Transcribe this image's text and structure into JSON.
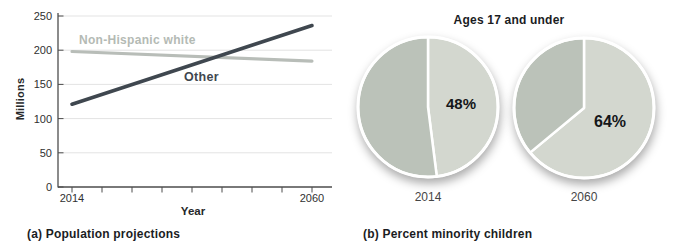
{
  "figure": {
    "panel_a": {
      "caption": "(a) Population projections",
      "xlabel": "Year",
      "ylabel": "Millions",
      "series_labels": {
        "white": "Non-Hispanic white",
        "other": "Other"
      }
    },
    "panel_b": {
      "title": "Ages 17 and under",
      "caption": "(b) Percent minority children",
      "pies": [
        {
          "year": "2014",
          "pct_label": "48%"
        },
        {
          "year": "2060",
          "pct_label": "64%"
        }
      ]
    }
  },
  "chart_data": [
    {
      "type": "line",
      "title": "(a) Population projections",
      "xlabel": "Year",
      "ylabel": "Millions",
      "x": [
        2014,
        2060
      ],
      "ylim": [
        0,
        250
      ],
      "yticks": [
        0,
        50,
        100,
        150,
        200,
        250
      ],
      "grid": true,
      "legend_position": "inline-labels",
      "series": [
        {
          "name": "Non-Hispanic white",
          "values": [
            198,
            184
          ],
          "color": "#b8bdb8"
        },
        {
          "name": "Other",
          "values": [
            121,
            236
          ],
          "color": "#3f474f"
        }
      ]
    },
    {
      "type": "pie",
      "title": "Ages 17 and under",
      "caption": "(b) Percent minority children",
      "categories": [
        "2014",
        "2060"
      ],
      "pies": [
        {
          "category": "2014",
          "slices": [
            {
              "label": "minority",
              "value": 48
            },
            {
              "label": "non-minority",
              "value": 52
            }
          ]
        },
        {
          "category": "2060",
          "slices": [
            {
              "label": "minority",
              "value": 64
            },
            {
              "label": "non-minority",
              "value": 36
            }
          ]
        }
      ],
      "colors": {
        "minority": "#d3d7cf",
        "non_minority": "#bbc2b9",
        "divider": "#ffffff"
      }
    }
  ]
}
